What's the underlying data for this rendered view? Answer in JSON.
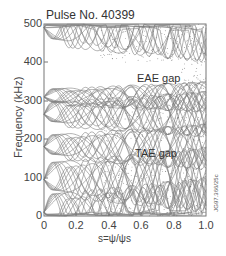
{
  "chart_data": {
    "type": "line",
    "title": "Pulse No. 40399",
    "xlabel": "s=ψ/ψs",
    "ylabel": "Frequency (kHz)",
    "xlim": [
      0,
      1.0
    ],
    "ylim": [
      0,
      500
    ],
    "xticks": [
      "0",
      "0.2",
      "0.4",
      "0.6",
      "0.8",
      "1.0"
    ],
    "yticks": [
      "0",
      "100",
      "200",
      "300",
      "400",
      "500"
    ],
    "grid": false,
    "legend": null,
    "annotations": [
      {
        "text": "EAE gap",
        "x": 0.72,
        "y": 360
      },
      {
        "text": "TAE gap",
        "x": 0.71,
        "y": 165
      }
    ],
    "doc_id": "JG97.366/25c",
    "gap_bounds_khz": {
      "TAE_gap": {
        "lower": 130,
        "upper": 195
      },
      "EAE_gap": {
        "lower": 315,
        "upper": 400
      }
    },
    "convergence_points": [
      {
        "s": 0.08,
        "f": 95
      },
      {
        "s": 0.5,
        "f": 0
      },
      {
        "s": 0.5,
        "f": 300
      },
      {
        "s": 0.08,
        "f": 265
      },
      {
        "s": 0.08,
        "f": 490
      }
    ]
  },
  "labels": {
    "title": "Pulse No. 40399",
    "ylabel": "Frequency (kHz)",
    "xlabel": "s=ψ/ψs",
    "eae": "EAE gap",
    "tae": "TAE gap",
    "docid": "JG97.366/25c"
  },
  "axes": {
    "y": [
      {
        "label": "500",
        "top": 17
      },
      {
        "label": "400",
        "top": 55
      },
      {
        "label": "300",
        "top": 94
      },
      {
        "label": "200",
        "top": 132
      },
      {
        "label": "100",
        "top": 171
      },
      {
        "label": "0",
        "top": 209
      }
    ],
    "x": [
      {
        "label": "0",
        "left": 29
      },
      {
        "label": "0.2",
        "left": 61
      },
      {
        "label": "0.4",
        "left": 94
      },
      {
        "label": "0.6",
        "left": 126
      },
      {
        "label": "0.8",
        "left": 159
      },
      {
        "label": "1.0",
        "left": 191
      }
    ]
  }
}
